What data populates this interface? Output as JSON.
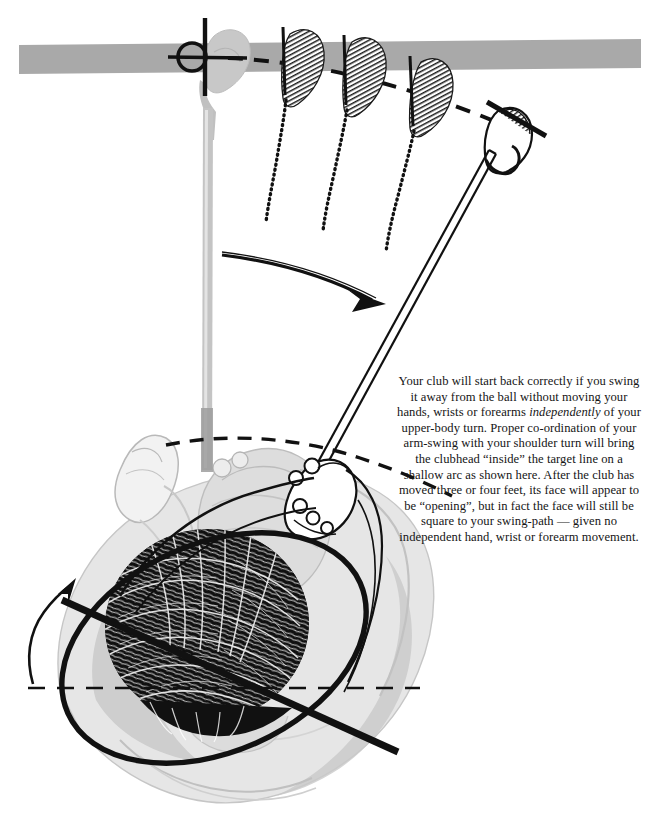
{
  "figure": {
    "kind": "golf-instruction-illustration",
    "title_text_present": false,
    "colors": {
      "ink": "#111111",
      "target_line_gray": "#a9a9a9",
      "body_gray_light": "#cfcfcf",
      "body_gray_mid": "#b5b5b5",
      "paper": "#ffffff"
    }
  },
  "caption": {
    "full_text": "Your club will start back correctly if you swing it away from the ball without moving your hands, wrists or forearms independently of your upper-body turn. Proper co-ordination of your arm-swing with your shoulder turn will bring the clubhead \"inside\" the target line on a shallow arc as shown here. After the club has moved three or four feet, its face will appear to be \"opening\", but in fact the face will still be square to your swing-path — given no independent hand, wrist or forearm movement.",
    "segments": [
      {
        "text": "Your club will start back correctly if you swing it away from the ball without moving your hands, wrists or forearms ",
        "style": "normal"
      },
      {
        "text": "independently",
        "style": "italic"
      },
      {
        "text": " of your upper-body turn. Proper co-ordination of your arm-swing with your shoulder turn will bring the clubhead “inside” the target line on a shallow arc as shown here. After the club has moved three or four feet, its face will appear to be “opening”, but in fact the face will still be square to your swing-path — given no independent hand, wrist or forearm movement.",
        "style": "normal"
      }
    ],
    "lines": [
      "Your club will start back correctly if you swing",
      "it away from the ball without moving your",
      "hands, wrists or forearms independently of",
      "your upper-body turn. Proper co-ordination of",
      "your arm-swing with your shoulder turn will",
      "bring the clubhead “inside” the target line on a",
      "shallow arc as shown here. After the club has",
      "moved three or four feet, its face will appear to",
      "be “opening”, but in fact the face will still be",
      "square to your swing-path — given no",
      "independent hand, wrist or forearm movement."
    ],
    "emphasis_word": "independently",
    "alignment": "center"
  },
  "elements": {
    "target_line_label": "target-line-band",
    "ball_label": "golf-ball",
    "address_club_label": "club-at-address",
    "ghost_clubs_count": 3,
    "final_club_label": "club-after-takeaway",
    "swing_arrow_label": "takeaway-direction-arrow",
    "shoulder_turn_arrow_label": "shoulder-turn-arrow",
    "shoulder_line_label": "shoulder-alignment-line",
    "shoulder_circle_label": "shoulder-turn-ellipse",
    "hip_line_label": "hip-line-dashed",
    "arc_label": "swing-arc-dashed",
    "golfer_label": "golfer-overhead-view"
  }
}
